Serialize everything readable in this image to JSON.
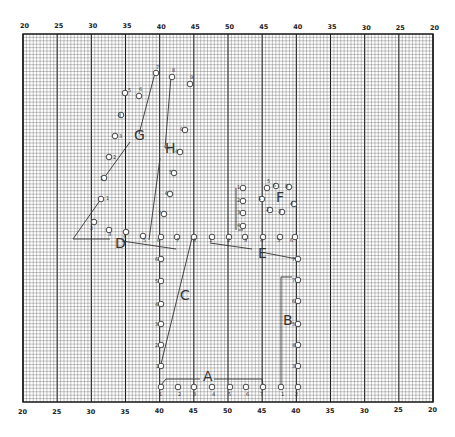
{
  "grid": {
    "left": 23,
    "right": 433,
    "top": 34,
    "bottom": 402,
    "major_cols": 12,
    "minor_per_major": 10,
    "minor_step_y": 3.4,
    "line_color": "#555555",
    "major_color": "#1a1a1a",
    "frame_color": "#111111"
  },
  "axis": {
    "top_ticks": [
      "20",
      "25",
      "30",
      "35",
      "40",
      "45",
      "50",
      "45",
      "40",
      "35",
      "30",
      "25",
      "20"
    ],
    "bottom_ticks": [
      "20",
      "25",
      "30",
      "35",
      "40",
      "45",
      "50",
      "45",
      "40",
      "35",
      "30",
      "25",
      "20"
    ]
  },
  "groups": {
    "A": {
      "label": "A",
      "label_pos": [
        203,
        381
      ]
    },
    "B": {
      "label": "B",
      "label_pos": [
        283,
        325
      ]
    },
    "C": {
      "label": "C",
      "label_pos": [
        180,
        300
      ]
    },
    "D": {
      "label": "D",
      "label_pos": [
        115,
        248
      ]
    },
    "E": {
      "label": "E",
      "label_pos": [
        258,
        258
      ]
    },
    "F": {
      "label": "F",
      "label_pos": [
        276,
        202
      ]
    },
    "G": {
      "label": "G",
      "label_pos": [
        134,
        140
      ]
    },
    "H": {
      "label": "H",
      "label_pos": [
        165,
        153
      ]
    }
  },
  "points": [
    {
      "n": "1",
      "x": 161,
      "y": 387,
      "nx": 159,
      "ny": 396
    },
    {
      "n": "2",
      "x": 178,
      "y": 387,
      "nx": 178,
      "ny": 396
    },
    {
      "n": "3",
      "x": 194,
      "y": 387,
      "nx": 193,
      "ny": 396
    },
    {
      "n": "4",
      "x": 212,
      "y": 387,
      "nx": 212,
      "ny": 396
    },
    {
      "n": "5",
      "x": 230,
      "y": 387,
      "nx": 228,
      "ny": 396
    },
    {
      "n": "6",
      "x": 246,
      "y": 387,
      "nx": 246,
      "ny": 396
    },
    {
      "n": "7",
      "x": 263,
      "y": 387,
      "nx": 260,
      "ny": 396
    },
    {
      "n": "1",
      "x": 281,
      "y": 387,
      "nx": 281,
      "ny": 396
    },
    {
      "n": "2",
      "x": 298,
      "y": 387,
      "nx": 295,
      "ny": 396
    },
    {
      "n": "1",
      "x": 161,
      "y": 366,
      "nx": 156,
      "ny": 368
    },
    {
      "n": "2",
      "x": 161,
      "y": 345,
      "nx": 155,
      "ny": 347
    },
    {
      "n": "3",
      "x": 161,
      "y": 324,
      "nx": 155,
      "ny": 326
    },
    {
      "n": "4",
      "x": 161,
      "y": 304,
      "nx": 155,
      "ny": 306
    },
    {
      "n": "5",
      "x": 161,
      "y": 281,
      "nx": 155,
      "ny": 283
    },
    {
      "n": "6",
      "x": 161,
      "y": 259,
      "nx": 155,
      "ny": 261
    },
    {
      "n": "3",
      "x": 298,
      "y": 366,
      "nx": 292,
      "ny": 368
    },
    {
      "n": "4",
      "x": 298,
      "y": 345,
      "nx": 292,
      "ny": 347
    },
    {
      "n": "5",
      "x": 298,
      "y": 324,
      "nx": 292,
      "ny": 326
    },
    {
      "n": "6",
      "x": 298,
      "y": 301,
      "nx": 292,
      "ny": 303
    },
    {
      "n": "7",
      "x": 298,
      "y": 280,
      "nx": 292,
      "ny": 282
    },
    {
      "n": "7",
      "x": 298,
      "y": 259,
      "nx": 292,
      "ny": 261
    },
    {
      "n": "1",
      "x": 101,
      "y": 199,
      "nx": 106,
      "ny": 200
    },
    {
      "n": "2",
      "x": 94,
      "y": 222,
      "nx": 90,
      "ny": 230
    },
    {
      "n": "3",
      "x": 109,
      "y": 230,
      "nx": 108,
      "ny": 236
    },
    {
      "n": "4",
      "x": 126,
      "y": 232,
      "nx": 123,
      "ny": 238
    },
    {
      "n": "5",
      "x": 143,
      "y": 236,
      "nx": 143,
      "ny": 242
    },
    {
      "n": "6",
      "x": 161,
      "y": 237,
      "nx": 157,
      "ny": 242
    },
    {
      "n": "7",
      "x": 177,
      "y": 237,
      "nx": 176,
      "ny": 242
    },
    {
      "n": "8",
      "x": 194,
      "y": 237,
      "nx": 193,
      "ny": 242
    },
    {
      "n": "1",
      "x": 104,
      "y": 178,
      "nx": 100,
      "ny": 180
    },
    {
      "n": "2",
      "x": 109,
      "y": 157,
      "nx": 113,
      "ny": 159
    },
    {
      "n": "3",
      "x": 115,
      "y": 136,
      "nx": 119,
      "ny": 138
    },
    {
      "n": "4",
      "x": 121,
      "y": 115,
      "nx": 118,
      "ny": 117
    },
    {
      "n": "5",
      "x": 125,
      "y": 93,
      "nx": 128,
      "ny": 92
    },
    {
      "n": "6",
      "x": 139,
      "y": 96,
      "nx": 139,
      "ny": 91
    },
    {
      "n": "7",
      "x": 156,
      "y": 73,
      "nx": 156,
      "ny": 69
    },
    {
      "n": "8",
      "x": 172,
      "y": 77,
      "nx": 172,
      "ny": 72
    },
    {
      "n": "9",
      "x": 190,
      "y": 84,
      "nx": 190,
      "ny": 79
    },
    {
      "n": "9",
      "x": 185,
      "y": 130,
      "nx": 180,
      "ny": 131
    },
    {
      "n": "4",
      "x": 180,
      "y": 152,
      "nx": 175,
      "ny": 153
    },
    {
      "n": "5",
      "x": 174,
      "y": 173,
      "nx": 169,
      "ny": 174
    },
    {
      "n": "6",
      "x": 170,
      "y": 194,
      "nx": 165,
      "ny": 195
    },
    {
      "n": "7",
      "x": 164,
      "y": 214,
      "nx": 158,
      "ny": 215
    },
    {
      "n": "1",
      "x": 243,
      "y": 188,
      "nx": 237,
      "ny": 189
    },
    {
      "n": "2",
      "x": 243,
      "y": 201,
      "nx": 237,
      "ny": 202
    },
    {
      "n": "3",
      "x": 243,
      "y": 213,
      "nx": 237,
      "ny": 214
    },
    {
      "n": "4",
      "x": 243,
      "y": 226,
      "nx": 237,
      "ny": 227
    },
    {
      "n": "1",
      "x": 262,
      "y": 199,
      "nx": 258,
      "ny": 200
    },
    {
      "n": "2",
      "x": 270,
      "y": 210,
      "nx": 266,
      "ny": 211
    },
    {
      "n": "3",
      "x": 282,
      "y": 212,
      "nx": 278,
      "ny": 213
    },
    {
      "n": "4",
      "x": 294,
      "y": 204,
      "nx": 290,
      "ny": 205
    },
    {
      "n": "5",
      "x": 267,
      "y": 188,
      "nx": 267,
      "ny": 183
    },
    {
      "n": "6",
      "x": 276,
      "y": 186,
      "nx": 273,
      "ny": 187
    },
    {
      "n": "8",
      "x": 289,
      "y": 187,
      "nx": 285,
      "ny": 188
    },
    {
      "n": "1",
      "x": 212,
      "y": 237,
      "nx": 209,
      "ny": 242
    },
    {
      "n": "2",
      "x": 229,
      "y": 237,
      "nx": 227,
      "ny": 242
    },
    {
      "n": "3",
      "x": 245,
      "y": 237,
      "nx": 244,
      "ny": 242
    },
    {
      "n": "4",
      "x": 263,
      "y": 237,
      "nx": 260,
      "ny": 242
    },
    {
      "n": "5",
      "x": 280,
      "y": 237,
      "nx": 277,
      "ny": 242
    },
    {
      "n": "6",
      "x": 295,
      "y": 237,
      "nx": 290,
      "ny": 242
    }
  ],
  "paths": {
    "A": "M161,385 L166,379 L200,379 M214,379 L262,379 L263,385",
    "B": "M281,386 L281,277 L292,277",
    "C": "M161,364 L192,238",
    "D": "M101,199 L73,239 L110,239 M122,241 L176,249",
    "E": "M210,243 L252,249 M266,253 L297,259",
    "G": "M104,178 L130,142 M139,134 L155,73",
    "H": "M171,77 L165,148 L170,148 M160,158 L149,240",
    "F": "M236,188 L236,230 M238,230 L243,230"
  }
}
